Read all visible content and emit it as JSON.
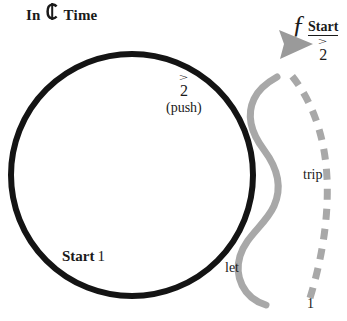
{
  "title": {
    "prefix": "In",
    "meter_symbol": "cut-time",
    "suffix": "Time",
    "full_text": "In ¢ Time"
  },
  "colors": {
    "background": "#ffffff",
    "circle_stroke": "#141414",
    "curve_gray": "#a8a8a8",
    "dashed_gray": "#a8a8a8",
    "arrowhead": "#9a9a9a",
    "text": "#1a1a1a"
  },
  "circle": {
    "name": "main-loop",
    "center_x": 132,
    "center_y": 175,
    "radius": 121,
    "stroke_width": 6
  },
  "labels": {
    "push": {
      "accent": ">",
      "beat": "2",
      "note": "(push)"
    },
    "start_one": {
      "word": "Start",
      "beat": "1"
    },
    "start_two": {
      "word": "Start",
      "accent": ">",
      "beat": "2"
    },
    "script_f": "ƒ",
    "trip": "trip",
    "let": "let",
    "one": "1"
  },
  "curves": {
    "solid_serpentine": {
      "name": "solid-gray-s-curve",
      "stroke_width": 7,
      "dashed": false
    },
    "dashed_arc": {
      "name": "dashed-gray-arc",
      "stroke_width": 7,
      "dashed": true,
      "dash_pattern": "11 9"
    },
    "arrowhead": {
      "name": "arrowhead",
      "direction": "right"
    }
  }
}
